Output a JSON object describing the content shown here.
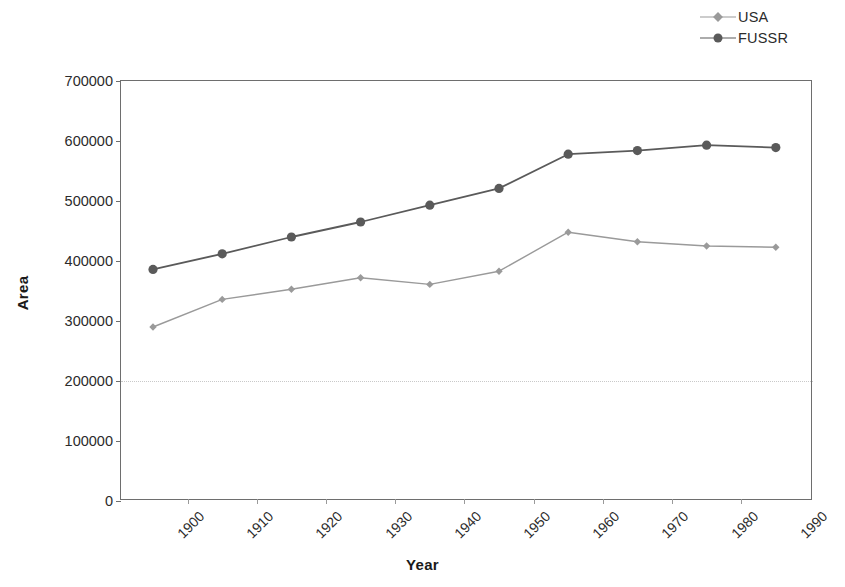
{
  "chart_data": {
    "type": "line",
    "title": "",
    "xlabel": "Year",
    "ylabel": "Area",
    "categories": [
      "1900",
      "1910",
      "1920",
      "1930",
      "1940",
      "1950",
      "1960",
      "1970",
      "1980",
      "1990"
    ],
    "x": [
      1900,
      1910,
      1920,
      1930,
      1940,
      1950,
      1960,
      1970,
      1980,
      1990
    ],
    "series": [
      {
        "name": "USA",
        "color": "#9a9a9a",
        "marker": "diamond",
        "values": [
          290000,
          336000,
          353000,
          372000,
          361000,
          383000,
          448000,
          432000,
          425000,
          423000
        ]
      },
      {
        "name": "FUSSR",
        "color": "#5a5a5a",
        "marker": "circle",
        "values": [
          386000,
          412000,
          440000,
          465000,
          493000,
          521000,
          578000,
          584000,
          593000,
          589000
        ]
      }
    ],
    "ylim": [
      0,
      700000
    ],
    "yticks": [
      0,
      100000,
      200000,
      300000,
      400000,
      500000,
      600000,
      700000
    ],
    "ytick_labels": [
      "0",
      "100000",
      "200000",
      "300000",
      "400000",
      "500000",
      "600000",
      "700000"
    ],
    "xtick_labels": [
      "1900",
      "1910",
      "1920",
      "1930",
      "1940",
      "1950",
      "1960",
      "1970",
      "1980",
      "1990"
    ],
    "grid": "horizontal-dotted-at-200000",
    "gridlines_at": [
      200000
    ],
    "legend_position": "top-right",
    "xtick_rotation": -45
  },
  "legend": {
    "entries": [
      {
        "label": "USA"
      },
      {
        "label": "FUSSR"
      }
    ]
  },
  "axes": {
    "x_title": "Year",
    "y_title": "Area"
  },
  "colors": {
    "usa": "#9a9a9a",
    "fussr": "#5a5a5a",
    "frame": "#6e6e6e",
    "gridline": "#c9c9c9",
    "text": "#2b2b2b"
  }
}
